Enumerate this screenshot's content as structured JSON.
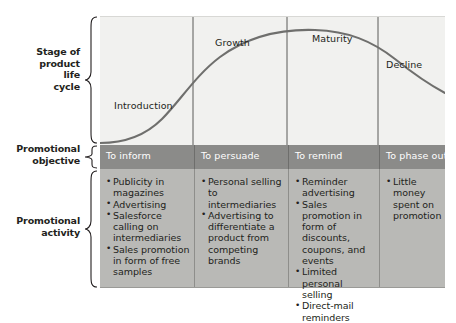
{
  "figure": {
    "row_labels": [
      {
        "id": "stage",
        "text": "Stage of\nproduct\nlife\ncycle"
      },
      {
        "id": "objective",
        "text": "Promotional\nobjective"
      },
      {
        "id": "activity",
        "text": "Promotional\nactivity"
      }
    ],
    "stages": [
      "Introduction",
      "Growth",
      "Maturity",
      "Decline"
    ],
    "objectives": [
      "To inform",
      "To persuade",
      "To remind",
      "To phase out"
    ],
    "activities": [
      [
        "Publicity in magazines",
        "Advertising",
        "Salesforce calling on intermediaries",
        "Sales promotion in form of free samples"
      ],
      [
        "Personal selling to intermediaries",
        "Advertising to differentiate a product from competing brands"
      ],
      [
        "Reminder advertising",
        "Sales promotion in form of discounts, coupons, and events",
        "Limited personal selling",
        "Direct-mail reminders"
      ],
      [
        "Little money spent on promotion"
      ]
    ],
    "colors": {
      "chart_band": "#f1f1ef",
      "objective_band": "#8b8b89",
      "activity_band": "#b9b9b6",
      "curve": "#6f6f6d",
      "divider": "#5b5b59",
      "text": "#231f20",
      "objective_text": "#ffffff"
    }
  },
  "chart_data": {
    "type": "line",
    "title": "",
    "xlabel": "",
    "ylabel": "",
    "x": [
      0,
      5,
      10,
      15,
      20,
      27,
      35,
      42,
      50,
      58,
      66,
      74,
      82,
      90,
      100
    ],
    "y": [
      2,
      2.5,
      4,
      8,
      14,
      26,
      42,
      58,
      72,
      84,
      91,
      94,
      93,
      88,
      74
    ],
    "xlim": [
      0,
      100
    ],
    "ylim": [
      0,
      100
    ],
    "grid": false,
    "legend": false,
    "series": [
      {
        "name": "Product life cycle",
        "values": [
          2,
          2.5,
          4,
          8,
          14,
          26,
          42,
          58,
          72,
          84,
          91,
          94,
          93,
          88,
          74
        ]
      }
    ],
    "annotations": [
      {
        "label": "Introduction",
        "x": 7
      },
      {
        "label": "Growth",
        "x": 34
      },
      {
        "label": "Maturity",
        "x": 63
      },
      {
        "label": "Decline",
        "x": 88
      }
    ],
    "segment_boundaries": [
      27,
      55,
      81
    ]
  }
}
